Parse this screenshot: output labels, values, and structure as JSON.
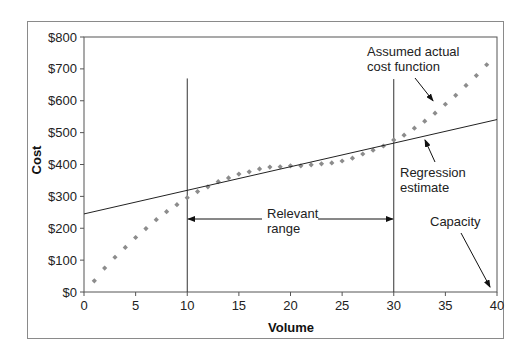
{
  "chart_data": {
    "type": "scatter",
    "title": "",
    "xlabel": "Volume",
    "ylabel": "Cost",
    "xlim": [
      0,
      40
    ],
    "ylim": [
      0,
      800
    ],
    "x_ticks": [
      0,
      5,
      10,
      15,
      20,
      25,
      30,
      35,
      40
    ],
    "x_tick_labels": [
      "0",
      "5",
      "10",
      "15",
      "20",
      "25",
      "30",
      "35",
      "40"
    ],
    "y_ticks": [
      0,
      100,
      200,
      300,
      400,
      500,
      600,
      700,
      800
    ],
    "y_tick_labels": [
      "$0",
      "$100",
      "$200",
      "$300",
      "$400",
      "$500",
      "$600",
      "$700",
      "$800"
    ],
    "grid": false,
    "legend": null,
    "series": [
      {
        "name": "Assumed actual cost function",
        "style": "dotted-markers",
        "color": "#8c8c8c",
        "x": [
          1,
          2,
          3,
          4,
          5,
          6,
          7,
          8,
          9,
          10,
          11,
          12,
          13,
          14,
          15,
          16,
          17,
          18,
          19,
          20,
          21,
          22,
          23,
          24,
          25,
          26,
          27,
          28,
          29,
          30,
          31,
          32,
          33,
          34,
          35,
          36,
          37,
          38,
          39
        ],
        "y": [
          35,
          75,
          109,
          140,
          171,
          199,
          227,
          252,
          274,
          296,
          315,
          330,
          346,
          358,
          370,
          377,
          386,
          392,
          393,
          396,
          396,
          399,
          402,
          405,
          411,
          420,
          433,
          445,
          458,
          477,
          492,
          514,
          536,
          561,
          589,
          617,
          648,
          679,
          713
        ]
      },
      {
        "name": "Regression estimate",
        "style": "line",
        "color": "#222222",
        "x": [
          0,
          40
        ],
        "y": [
          245,
          541
        ]
      }
    ],
    "reference_lines": [
      {
        "type": "vertical",
        "x": 10,
        "y_top": 670
      },
      {
        "type": "vertical",
        "x": 30,
        "y_top": 668
      }
    ],
    "annotations": [
      {
        "text": [
          "Assumed actual",
          "cost function"
        ],
        "arrow_to": {
          "x": 33.8,
          "y": 600
        }
      },
      {
        "text": [
          "Regression",
          "estimate"
        ],
        "arrow_to": {
          "x": 33,
          "y": 480
        }
      },
      {
        "text": [
          "Relevant",
          "range"
        ],
        "double_arrow": {
          "from_x": 10,
          "to_x": 30,
          "y": 230
        }
      },
      {
        "text": [
          "Capacity"
        ],
        "arrow_to": {
          "x": 39.5,
          "y": 15
        }
      }
    ]
  }
}
